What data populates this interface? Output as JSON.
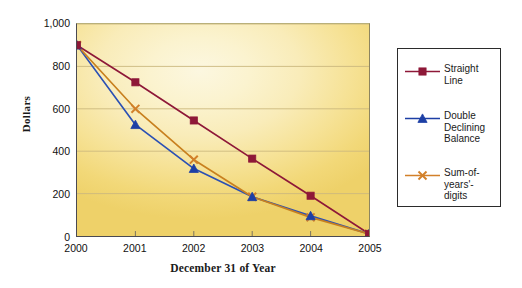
{
  "chart_data": {
    "type": "line",
    "title": "",
    "xlabel": "December 31 of Year",
    "ylabel": "Dollars",
    "categories": [
      "2000",
      "2001",
      "2002",
      "2003",
      "2004",
      "2005"
    ],
    "x_tick_labels": [
      "2000",
      "2001",
      "2002",
      "2003",
      "2004",
      "2005"
    ],
    "y_tick_labels": [
      "0",
      "200",
      "400",
      "600",
      "800",
      "1,000"
    ],
    "y_tick_values": [
      0,
      200,
      400,
      600,
      800,
      1000
    ],
    "ylim": [
      0,
      1000
    ],
    "grid": "horizontal",
    "legend_position": "right-outside",
    "series": [
      {
        "name": "Straight\nLine",
        "legend_label": "Straight\nLine",
        "marker": "square",
        "color": "#8e1838",
        "line_color": "#8e1838",
        "values": [
          900,
          725,
          545,
          365,
          190,
          10
        ]
      },
      {
        "name": "Double\nDeclining\nBalance",
        "legend_label": "Double\nDeclining\nBalance",
        "marker": "triangle",
        "color": "#1d3fa5",
        "line_color": "#2b50b4",
        "values": [
          900,
          525,
          318,
          185,
          95,
          10
        ]
      },
      {
        "name": "Sum-of-\nyears'-\ndigits",
        "legend_label": "Sum-of-\nyears'-\ndigits",
        "marker": "x",
        "color": "#d2802a",
        "line_color": "#c8801f",
        "values": [
          900,
          600,
          360,
          185,
          88,
          10
        ]
      }
    ]
  },
  "colors": {
    "straight_line": "#8e1838",
    "double_declining": "#1d3fa5",
    "sum_of_years_digits": "#d2802a",
    "plot_bg_light": "#fcf7e0",
    "plot_bg_dark": "#eed169",
    "axis": "#4a4a52",
    "gridline": "#cbb87e",
    "legend_border": "#2b2b2b",
    "text": "#1a1a1a"
  },
  "legend": {
    "items": [
      {
        "label": "Straight\nLine",
        "marker": "square-marker",
        "color": "#8e1838"
      },
      {
        "label": "Double\nDeclining\nBalance",
        "marker": "triangle-marker",
        "color": "#1d3fa5"
      },
      {
        "label": "Sum-of-\nyears'-\ndigits",
        "marker": "x-marker",
        "color": "#d2802a"
      }
    ]
  }
}
